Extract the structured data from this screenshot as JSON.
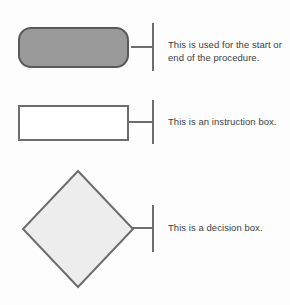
{
  "diagram": {
    "background_color": "#fdfdfd",
    "text_color": "#3d3d3d",
    "rows": [
      {
        "shape": "rounded-rectangle-terminator",
        "shape_name": "terminator",
        "fill_color": "#9a9a9a",
        "stroke_color": "#595959",
        "connector": "leader-line-with-end-bar",
        "description": "This is used for the start or end of the procedure."
      },
      {
        "shape": "rectangle-process",
        "shape_name": "instruction box",
        "fill_color": "#ffffff",
        "stroke_color": "#6d6d6d",
        "connector": "leader-line-with-end-bar",
        "description": "This is an instruction box."
      },
      {
        "shape": "diamond-decision",
        "shape_name": "decision box",
        "fill_color": "#ededed",
        "stroke_color": "#6d6d6d",
        "connector": "leader-line-with-end-bar",
        "description": "This is a decision box."
      }
    ]
  }
}
